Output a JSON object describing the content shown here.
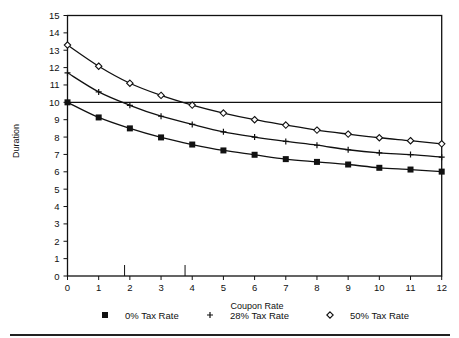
{
  "chart_data": {
    "type": "line",
    "title": "",
    "xlabel": "Coupon Rate",
    "ylabel": "Duration",
    "xlim": [
      0,
      12
    ],
    "ylim": [
      0,
      15
    ],
    "x_ticks": [
      0,
      1,
      2,
      3,
      4,
      5,
      6,
      7,
      8,
      9,
      10,
      11,
      12
    ],
    "y_ticks": [
      0,
      1,
      2,
      3,
      4,
      5,
      6,
      7,
      8,
      9,
      10,
      11,
      12,
      13,
      14,
      15
    ],
    "grid": false,
    "legend_position": "bottom",
    "x": [
      0,
      1,
      2,
      3,
      4,
      5,
      6,
      7,
      8,
      9,
      10,
      11,
      12
    ],
    "series": [
      {
        "name": "0% Tax Rate",
        "marker": "square",
        "values": [
          10.0,
          9.13,
          8.5,
          7.98,
          7.57,
          7.23,
          6.98,
          6.73,
          6.57,
          6.42,
          6.23,
          6.13,
          6.01
        ]
      },
      {
        "name": "28% Tax Rate",
        "marker": "plus",
        "values": [
          11.7,
          10.6,
          9.83,
          9.2,
          8.73,
          8.3,
          8.0,
          7.75,
          7.53,
          7.27,
          7.09,
          6.99,
          6.84
        ]
      },
      {
        "name": "50% Tax Rate",
        "marker": "diamond",
        "values": [
          13.3,
          12.08,
          11.1,
          10.4,
          9.84,
          9.38,
          9.0,
          8.69,
          8.4,
          8.17,
          7.96,
          7.79,
          7.61
        ]
      }
    ],
    "annotations": {
      "reference_line_y": 10,
      "x_axis_markers": [
        1.83,
        3.77
      ]
    }
  },
  "legend": {
    "items": [
      {
        "label": "0% Tax Rate",
        "marker": "square"
      },
      {
        "label": "28% Tax Rate",
        "marker": "plus"
      },
      {
        "label": "50% Tax Rate",
        "marker": "diamond"
      }
    ]
  },
  "colors": {
    "ink": "#111111",
    "background": "#ffffff"
  }
}
